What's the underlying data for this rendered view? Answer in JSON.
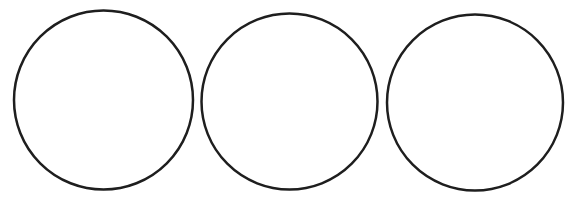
{
  "diagram": {
    "background": "#ffffff",
    "stroke_color": "#1e1e1e",
    "stroke_width": 2.5,
    "circles": [
      {
        "cx": 103.5,
        "cy": 100,
        "r": 89.5
      },
      {
        "cx": 289.5,
        "cy": 101.5,
        "r": 88
      },
      {
        "cx": 475,
        "cy": 102.5,
        "r": 88
      }
    ]
  }
}
